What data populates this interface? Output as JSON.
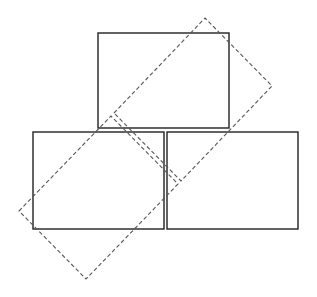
{
  "diagram": {
    "background": "#ffffff",
    "solid_color": "#222222",
    "dashed_color": "#555555",
    "solid_rects": [
      {
        "name": "top-rect",
        "x": 98,
        "y": 33,
        "w": 131,
        "h": 95
      },
      {
        "name": "bottom-left-rect",
        "x": 33,
        "y": 132,
        "w": 131,
        "h": 97
      },
      {
        "name": "bottom-right-rect",
        "x": 167,
        "y": 132,
        "w": 131,
        "h": 97
      }
    ],
    "dashed_polygons": [
      {
        "name": "upper-rotated-rect",
        "points": "114,113 205,18 272,86 181,181"
      },
      {
        "name": "lower-rotated-rect",
        "points": "19,211 111,116 178,184 86,279"
      }
    ]
  }
}
